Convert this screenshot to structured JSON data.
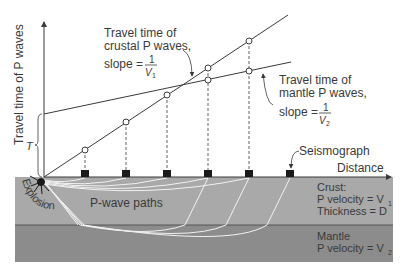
{
  "diagram": {
    "y_axis_label": "Travel time of P waves",
    "x_axis_label": "Distance",
    "intercept_label": "T",
    "crustal_annotation": {
      "line1": "Travel time of",
      "line2": "crustal P waves,",
      "slope_prefix": "slope =",
      "numerator": "1",
      "denominator": "V",
      "denominator_sub": "1"
    },
    "mantle_annotation": {
      "line1": "Travel time of",
      "line2": "mantle P waves,",
      "slope_prefix": "slope =",
      "numerator": "1",
      "denominator": "V",
      "denominator_sub": "2"
    },
    "seismograph_label": "Seismograph",
    "explosion_label": "Explosion",
    "pwave_paths_label": "P-wave paths",
    "crust": {
      "title": "Crust:",
      "velocity_label": "P velocity = V",
      "velocity_sub": "1",
      "thickness_label": "Thickness = D"
    },
    "mantle": {
      "title": "Mantle",
      "velocity_label": "P velocity = V",
      "velocity_sub": "2"
    },
    "colors": {
      "crust": "#a9a9a9",
      "mantle": "#8c8c8c",
      "lines": "#3a3a3a",
      "paths": "#f2f2f2"
    },
    "seismograph_x": [
      85,
      126,
      167,
      208,
      249,
      290
    ]
  }
}
